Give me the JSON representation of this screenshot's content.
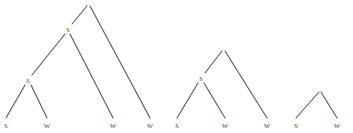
{
  "figure": {
    "kind": "syntax-tree-diagram",
    "background_color": "#ffffff",
    "stroke_color": "#575757",
    "text_color": "#5a5a5a",
    "width": 353,
    "height": 133,
    "trees": [
      {
        "id": "tree-1",
        "name": "left-branching-tree-depth-3",
        "nodes": [
          {
            "id": "t1-root",
            "label": "",
            "x": 88,
            "y": 4
          },
          {
            "id": "t1-n1",
            "label": "s",
            "x": 68,
            "y": 29
          },
          {
            "id": "t1-n2",
            "label": "s",
            "x": 28,
            "y": 80
          },
          {
            "id": "t1-leaf1",
            "label": "s",
            "x": 6,
            "y": 125
          },
          {
            "id": "t1-leaf2",
            "label": "w",
            "x": 47,
            "y": 125
          },
          {
            "id": "t1-leaf3",
            "label": "w",
            "x": 113,
            "y": 125
          },
          {
            "id": "t1-leaf4",
            "label": "w",
            "x": 150,
            "y": 125
          }
        ],
        "edges": [
          {
            "from": "t1-root",
            "to": "t1-n1",
            "x1": 87,
            "y1": 6,
            "x2": 72,
            "y2": 24
          },
          {
            "from": "t1-root",
            "to": "t1-leaf4",
            "x1": 90,
            "y1": 6,
            "x2": 150,
            "y2": 118
          },
          {
            "from": "t1-n1",
            "to": "t1-n2",
            "x1": 65,
            "y1": 34,
            "x2": 32,
            "y2": 75
          },
          {
            "from": "t1-n1",
            "to": "t1-leaf3",
            "x1": 70,
            "y1": 34,
            "x2": 113,
            "y2": 118
          },
          {
            "from": "t1-n2",
            "to": "t1-leaf1",
            "x1": 25,
            "y1": 85,
            "x2": 6,
            "y2": 118
          },
          {
            "from": "t1-n2",
            "to": "t1-leaf2",
            "x1": 31,
            "y1": 85,
            "x2": 47,
            "y2": 118
          }
        ]
      },
      {
        "id": "tree-2",
        "name": "left-branching-tree-depth-2",
        "nodes": [
          {
            "id": "t2-root",
            "label": "",
            "x": 223,
            "y": 49
          },
          {
            "id": "t2-n1",
            "label": "s",
            "x": 201,
            "y": 78
          },
          {
            "id": "t2-leaf1",
            "label": "s",
            "x": 177,
            "y": 125
          },
          {
            "id": "t2-leaf2",
            "label": "w",
            "x": 225,
            "y": 125
          },
          {
            "id": "t2-leaf3",
            "label": "w",
            "x": 267,
            "y": 125
          }
        ],
        "edges": [
          {
            "from": "t2-root",
            "to": "t2-n1",
            "x1": 222,
            "y1": 51,
            "x2": 205,
            "y2": 73
          },
          {
            "from": "t2-root",
            "to": "t2-leaf3",
            "x1": 225,
            "y1": 51,
            "x2": 267,
            "y2": 118
          },
          {
            "from": "t2-n1",
            "to": "t2-leaf1",
            "x1": 198,
            "y1": 83,
            "x2": 177,
            "y2": 118
          },
          {
            "from": "t2-n1",
            "to": "t2-leaf2",
            "x1": 204,
            "y1": 83,
            "x2": 225,
            "y2": 118
          }
        ]
      },
      {
        "id": "tree-3",
        "name": "binary-tree-depth-1",
        "nodes": [
          {
            "id": "t3-root",
            "label": "",
            "x": 320,
            "y": 90
          },
          {
            "id": "t3-leaf1",
            "label": "s",
            "x": 296,
            "y": 125
          },
          {
            "id": "t3-leaf2",
            "label": "w",
            "x": 337,
            "y": 125
          }
        ],
        "edges": [
          {
            "from": "t3-root",
            "to": "t3-leaf1",
            "x1": 319,
            "y1": 92,
            "x2": 296,
            "y2": 118
          },
          {
            "from": "t3-root",
            "to": "t3-leaf2",
            "x1": 321,
            "y1": 92,
            "x2": 337,
            "y2": 118
          }
        ]
      }
    ]
  }
}
